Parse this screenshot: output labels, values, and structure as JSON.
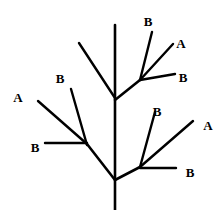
{
  "figure": {
    "kind": "branching-tree-diagram",
    "width": 222,
    "height": 210,
    "background_color": "#ffffff",
    "stroke_color": "#000000",
    "label_color": "#000000"
  },
  "trunk": {
    "name": "main-stem",
    "x1": 115,
    "y1": 25,
    "x2": 115,
    "y2": 210,
    "stroke_width": 2.6
  },
  "branches": [
    {
      "name": "upper-left-plain-branch",
      "x1": 115,
      "y1": 98,
      "x2": 79,
      "y2": 43,
      "stroke_width": 2.4,
      "label": null
    },
    {
      "name": "upper-right-main-branch",
      "x1": 115,
      "y1": 100,
      "x2": 140,
      "y2": 80,
      "stroke_width": 2.6,
      "label": null
    },
    {
      "name": "upper-right-steep-branch",
      "x1": 140,
      "y1": 80,
      "x2": 152,
      "y2": 32,
      "stroke_width": 2.4,
      "label": "B"
    },
    {
      "name": "upper-right-middle-branch",
      "x1": 140,
      "y1": 80,
      "x2": 173,
      "y2": 44,
      "stroke_width": 2.4,
      "label": "A"
    },
    {
      "name": "upper-right-flat-branch",
      "x1": 140,
      "y1": 80,
      "x2": 175,
      "y2": 74,
      "stroke_width": 2.4,
      "label": "B"
    },
    {
      "name": "left-main-branch",
      "x1": 115,
      "y1": 180,
      "x2": 87,
      "y2": 144,
      "stroke_width": 2.6,
      "label": null
    },
    {
      "name": "left-diagonal-branch",
      "x1": 87,
      "y1": 144,
      "x2": 38,
      "y2": 101,
      "stroke_width": 2.4,
      "label": "A"
    },
    {
      "name": "left-steep-branch",
      "x1": 87,
      "y1": 145,
      "x2": 71,
      "y2": 89,
      "stroke_width": 2.4,
      "label": "B"
    },
    {
      "name": "left-horizontal-branch",
      "x1": 87,
      "y1": 143,
      "x2": 45,
      "y2": 143,
      "stroke_width": 2.4,
      "label": "B"
    },
    {
      "name": "lower-right-main-branch",
      "x1": 115,
      "y1": 180,
      "x2": 140,
      "y2": 167,
      "stroke_width": 2.6,
      "label": null
    },
    {
      "name": "lower-right-steep-branch",
      "x1": 140,
      "y1": 167,
      "x2": 155,
      "y2": 112,
      "stroke_width": 2.4,
      "label": "B"
    },
    {
      "name": "lower-right-diagonal-branch",
      "x1": 140,
      "y1": 167,
      "x2": 193,
      "y2": 121,
      "stroke_width": 2.4,
      "label": "A"
    },
    {
      "name": "lower-right-horizontal-branch",
      "x1": 140,
      "y1": 168,
      "x2": 176,
      "y2": 168,
      "stroke_width": 2.4,
      "label": "B"
    }
  ],
  "labels": [
    {
      "name": "label-upper-right-top-b",
      "text": "B",
      "x": 148,
      "y": 21
    },
    {
      "name": "label-upper-right-a",
      "text": "A",
      "x": 181,
      "y": 43
    },
    {
      "name": "label-upper-right-b",
      "text": "B",
      "x": 183,
      "y": 77
    },
    {
      "name": "label-left-a",
      "text": "A",
      "x": 18,
      "y": 97
    },
    {
      "name": "label-left-upper-b",
      "text": "B",
      "x": 60,
      "y": 78
    },
    {
      "name": "label-left-lower-b",
      "text": "B",
      "x": 35,
      "y": 147
    },
    {
      "name": "label-lower-right-b",
      "text": "B",
      "x": 157,
      "y": 111
    },
    {
      "name": "label-lower-right-a",
      "text": "A",
      "x": 208,
      "y": 125
    },
    {
      "name": "label-lower-right-flat-b",
      "text": "B",
      "x": 190,
      "y": 172
    }
  ]
}
